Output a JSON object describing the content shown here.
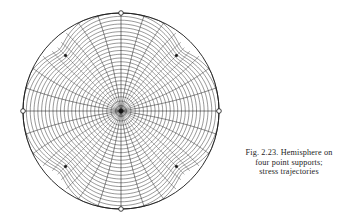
{
  "figure": {
    "caption_lines": [
      "Fig. 2.23. Hemisphere on",
      "four point supports;",
      "stress trajectories"
    ],
    "caption_full": "Fig. 2.23. Hemisphere on four point supports; stress trajectories",
    "figure_number": "2.23",
    "subject": "Hemisphere on four point supports; stress trajectories"
  },
  "diagram": {
    "type": "stress-trajectory-net",
    "projection": "plan view of hemisphere",
    "geometry": {
      "center_x": 121,
      "center_y": 111,
      "radius": 98,
      "boundary_stroke": "#141414",
      "mesh_stroke": "#1a1a1a",
      "background": "#ffffff"
    },
    "support_count": 4,
    "support_points": [
      {
        "name": "support-north",
        "angle_deg": 90,
        "type": "boundary-singularity"
      },
      {
        "name": "support-east",
        "angle_deg": 0,
        "type": "boundary-singularity"
      },
      {
        "name": "support-south",
        "angle_deg": 270,
        "type": "boundary-singularity"
      },
      {
        "name": "support-west",
        "angle_deg": 180,
        "type": "boundary-singularity"
      }
    ],
    "diagonal_nodes": [
      {
        "name": "node-ne",
        "angle_deg": 45,
        "radius_frac": 0.8
      },
      {
        "name": "node-nw",
        "angle_deg": 135,
        "radius_frac": 0.8
      },
      {
        "name": "node-sw",
        "angle_deg": 225,
        "radius_frac": 0.8
      },
      {
        "name": "node-se",
        "angle_deg": 315,
        "radius_frac": 0.8
      }
    ],
    "center_node": {
      "name": "node-crown",
      "angle_deg": 0,
      "radius_frac": 0.0
    },
    "mesh": {
      "family_a_label": "first principal stress trajectories",
      "family_b_label": "second principal stress trajectories",
      "family_a_count": 40,
      "family_b_count": 26,
      "stroke_width_min": 0.33,
      "stroke_width_max": 0.62,
      "sector_count": 4
    }
  }
}
